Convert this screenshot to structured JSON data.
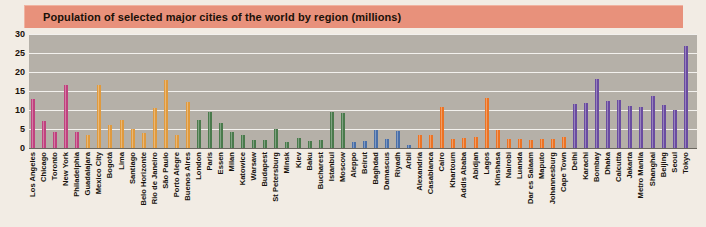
{
  "title": "Population of selected major cities of the world by region (millions)",
  "colors": {
    "title_bar": "#e8917b",
    "plot_background": "#b5b0a8",
    "gridline": "#f3f1ee",
    "axis": "#6a665f",
    "north_america": "#c0427e",
    "latin_america": "#e09a3e",
    "europe": "#4a7a4c",
    "middle_east": "#4a6fa8",
    "africa": "#ec7324",
    "asia": "#6a4ca0"
  },
  "chart_data": {
    "type": "bar",
    "title": "Population of selected major cities of the world by region (millions)",
    "xlabel": "",
    "ylabel": "",
    "ylim": [
      0,
      30
    ],
    "yticks": [
      0,
      5,
      10,
      15,
      20,
      25,
      30
    ],
    "grid": true,
    "legend_position": "none",
    "categories": [
      "Los Angeles",
      "Chicago",
      "Toronto",
      "New York",
      "Philadelphia",
      "Guadalajara",
      "Mexico City",
      "Bogotá",
      "Lima",
      "Santiago",
      "Belo Horizonte",
      "Rio de Janeiro",
      "São Paulo",
      "Porto Alegre",
      "Buenos Aires",
      "London",
      "Paris",
      "Essen",
      "Milan",
      "Katowice",
      "Warsaw",
      "Budapest",
      "St Petersburg",
      "Minsk",
      "Kiev",
      "Baku",
      "Bucharest",
      "Istanbul",
      "Moscow",
      "Aleppo",
      "Beirut",
      "Baghdad",
      "Damascus",
      "Riyadh",
      "Arbil",
      "Alexandria",
      "Casablanca",
      "Cairo",
      "Khartoum",
      "Addis Ababa",
      "Abidjan",
      "Lagos",
      "Kinshasa",
      "Nairobi",
      "Luanda",
      "Dar es Salaam",
      "Maputo",
      "Johannesburg",
      "Cape Town",
      "Delhi",
      "Karachi",
      "Bombay",
      "Dhaka",
      "Calcutta",
      "Jakarta",
      "Metro Manila",
      "Shanghai",
      "Beijing",
      "Seoul",
      "Tokyo"
    ],
    "values": [
      13.0,
      7.0,
      4.3,
      16.5,
      4.3,
      3.3,
      16.5,
      6.0,
      7.5,
      5.0,
      4.0,
      10.5,
      17.8,
      3.5,
      12.0,
      7.5,
      9.5,
      6.5,
      4.3,
      3.5,
      2.2,
      2.0,
      5.0,
      1.7,
      2.7,
      1.8,
      2.1,
      9.5,
      9.2,
      1.5,
      1.9,
      4.8,
      2.3,
      4.6,
      0.8,
      3.5,
      3.5,
      10.7,
      2.3,
      2.6,
      3.0,
      13.2,
      4.7,
      2.3,
      2.5,
      2.1,
      2.4,
      2.3,
      2.9,
      11.7,
      11.8,
      18.1,
      12.4,
      12.7,
      11.0,
      10.8,
      13.6,
      11.3,
      9.9,
      26.8
    ],
    "series_regions": [
      {
        "name": "North America",
        "color": "#c0427e",
        "count": 5
      },
      {
        "name": "Latin America",
        "color": "#e09a3e",
        "count": 10
      },
      {
        "name": "Europe",
        "color": "#4a7a4c",
        "count": 14
      },
      {
        "name": "Middle East",
        "color": "#4a6fa8",
        "count": 6
      },
      {
        "name": "Africa",
        "color": "#ec7324",
        "count": 14
      },
      {
        "name": "Asia",
        "color": "#6a4ca0",
        "count": 11
      }
    ],
    "bar_colors": [
      "#c0427e",
      "#c0427e",
      "#c0427e",
      "#c0427e",
      "#c0427e",
      "#e09a3e",
      "#e09a3e",
      "#e09a3e",
      "#e09a3e",
      "#e09a3e",
      "#e09a3e",
      "#e09a3e",
      "#e09a3e",
      "#e09a3e",
      "#e09a3e",
      "#4a7a4c",
      "#4a7a4c",
      "#4a7a4c",
      "#4a7a4c",
      "#4a7a4c",
      "#4a7a4c",
      "#4a7a4c",
      "#4a7a4c",
      "#4a7a4c",
      "#4a7a4c",
      "#4a7a4c",
      "#4a7a4c",
      "#4a7a4c",
      "#4a7a4c",
      "#4a6fa8",
      "#4a6fa8",
      "#4a6fa8",
      "#4a6fa8",
      "#4a6fa8",
      "#4a6fa8",
      "#ec7324",
      "#ec7324",
      "#ec7324",
      "#ec7324",
      "#ec7324",
      "#ec7324",
      "#ec7324",
      "#ec7324",
      "#ec7324",
      "#ec7324",
      "#ec7324",
      "#ec7324",
      "#ec7324",
      "#ec7324",
      "#6a4ca0",
      "#6a4ca0",
      "#6a4ca0",
      "#6a4ca0",
      "#6a4ca0",
      "#6a4ca0",
      "#6a4ca0",
      "#6a4ca0",
      "#6a4ca0",
      "#6a4ca0",
      "#6a4ca0"
    ]
  }
}
